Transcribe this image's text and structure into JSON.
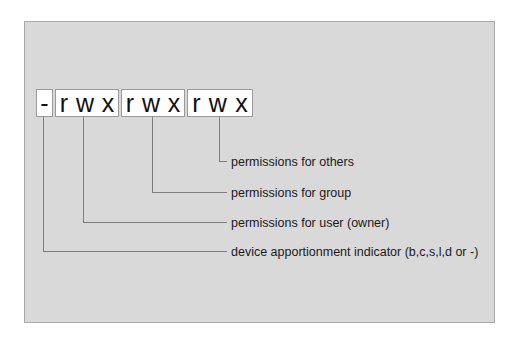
{
  "diagram": {
    "type_indicator": "-",
    "groups": [
      {
        "name": "user",
        "chars": [
          "r",
          "w",
          "x"
        ]
      },
      {
        "name": "group",
        "chars": [
          "r",
          "w",
          "x"
        ]
      },
      {
        "name": "others",
        "chars": [
          "r",
          "w",
          "x"
        ]
      }
    ],
    "labels": {
      "others": "permissions for others",
      "group": "permissions for group",
      "user": "permissions for user (owner)",
      "device": "device apportionment indicator (b,c,s,l,d or -)"
    },
    "colors": {
      "panel_bg": "#d9d9d9",
      "box_bg": "#ffffff",
      "line": "#7d7d7d",
      "text": "#111111"
    }
  }
}
